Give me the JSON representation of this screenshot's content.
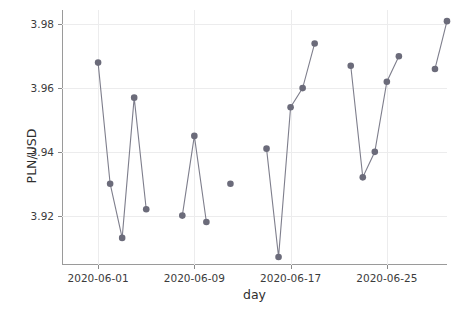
{
  "chart_data": {
    "type": "line",
    "title": "",
    "xlabel": "day",
    "ylabel": "PLN/USD",
    "grid": true,
    "legend": "none",
    "marker": "circle",
    "marker_color": "#6b6b7a",
    "line_color": "#7e7e8c",
    "xlim": [
      "2020-05-29",
      "2020-06-30"
    ],
    "ylim": [
      3.9045,
      3.9845
    ],
    "yticks": [
      "3.92",
      "3.94",
      "3.96",
      "3.98"
    ],
    "ytick_values": [
      3.92,
      3.94,
      3.96,
      3.98
    ],
    "xticks": [
      "2020-06-01",
      "2020-06-09",
      "2020-06-17",
      "2020-06-25"
    ],
    "xtick_days": [
      1,
      9,
      17,
      25
    ],
    "x": [
      "2020-06-01",
      "2020-06-02",
      "2020-06-03",
      "2020-06-04",
      "2020-06-05",
      "2020-06-08",
      "2020-06-09",
      "2020-06-10",
      "2020-06-12",
      "2020-06-15",
      "2020-06-16",
      "2020-06-17",
      "2020-06-18",
      "2020-06-19",
      "2020-06-22",
      "2020-06-23",
      "2020-06-24",
      "2020-06-25",
      "2020-06-26",
      "2020-06-29",
      "2020-06-30"
    ],
    "values": [
      3.968,
      3.93,
      3.913,
      3.957,
      3.922,
      3.92,
      3.945,
      3.918,
      3.93,
      3.941,
      3.907,
      3.954,
      3.96,
      3.974,
      3.967,
      3.932,
      3.94,
      3.962,
      3.97,
      3.966,
      3.981
    ],
    "segments": [
      [
        0,
        1,
        2,
        3,
        4
      ],
      [
        5,
        6,
        7
      ],
      [
        8
      ],
      [
        9,
        10,
        11,
        12,
        13
      ],
      [
        14,
        15,
        16,
        17,
        18
      ],
      [
        19,
        20
      ]
    ]
  }
}
